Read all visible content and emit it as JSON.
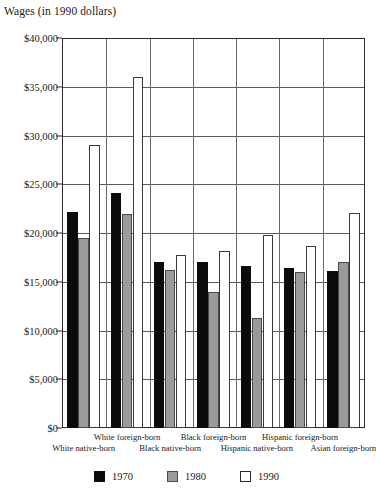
{
  "chart_data": {
    "type": "bar",
    "title": "Wages (in 1990 dollars)",
    "xlabel": "",
    "ylabel": "",
    "ylim": [
      0,
      40000
    ],
    "ytick_labels": [
      "$0",
      "$5,000",
      "$10,000",
      "$15,000",
      "$20,000",
      "$25,000",
      "$30,000",
      "$35,000",
      "$40,000"
    ],
    "ytick_values": [
      0,
      5000,
      10000,
      15000,
      20000,
      25000,
      30000,
      35000,
      40000
    ],
    "grid": true,
    "grid_axis": "y",
    "legend_position": "bottom",
    "categories": [
      "White native-born",
      "White foreign-born",
      "Black native-born",
      "Black foreign-born",
      "Hispanic native-born",
      "Hispanic foreign-born",
      "Asian foreign-born"
    ],
    "category_label_rows": [
      1,
      0,
      1,
      0,
      1,
      0,
      1
    ],
    "series": [
      {
        "name": "1970",
        "color": "#0b0b0b",
        "values": [
          22200,
          24100,
          17000,
          17000,
          16600,
          16400,
          16100
        ]
      },
      {
        "name": "1980",
        "color": "#9a9a9a",
        "values": [
          19500,
          22000,
          16200,
          14000,
          11300,
          16000,
          17000
        ]
      },
      {
        "name": "1990",
        "color": "#ffffff",
        "values": [
          29000,
          36000,
          17700,
          18200,
          19800,
          18700,
          22100
        ]
      }
    ]
  },
  "legend": {
    "items": [
      {
        "label": "1970",
        "key": "k1970"
      },
      {
        "label": "1980",
        "key": "k1980"
      },
      {
        "label": "1990",
        "key": "k1990"
      }
    ]
  }
}
